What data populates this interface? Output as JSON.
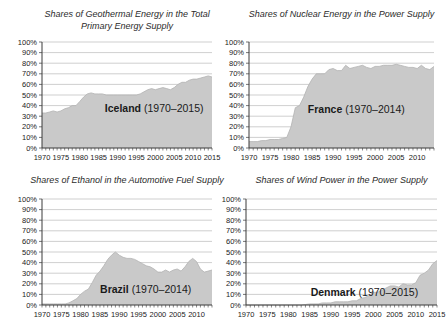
{
  "colors": {
    "area_fill": "#c9c9c9",
    "area_edge": "#b2b2b2",
    "grid": "#c3c3c3",
    "axis": "#3a3a3a",
    "tick_text": "#222222",
    "title_text": "#2b2b2b"
  },
  "chart_data": [
    {
      "id": "geothermal-iceland",
      "type": "area",
      "title": "Shares of Geothermal Energy in the Total Primary Energy Supply",
      "title_lines": [
        "Shares of Geothermal Energy in the Total",
        "Primary Energy Supply"
      ],
      "label_country": "Iceland",
      "label_range": "(1970–2015)",
      "xlim": [
        1970,
        2015
      ],
      "ylim": [
        0,
        100
      ],
      "grid": true,
      "x_tick_labels": [
        "1970",
        "1975",
        "1980",
        "1985",
        "1990",
        "1995",
        "2000",
        "2005",
        "2010",
        "2015"
      ],
      "y_tick_labels": [
        "0%",
        "10%",
        "20%",
        "30%",
        "40%",
        "50%",
        "60%",
        "70%",
        "80%",
        "90%",
        "100%"
      ],
      "x_start": 1970,
      "values": [
        33,
        33,
        34,
        35,
        34,
        35,
        37,
        38,
        40,
        40,
        44,
        48,
        51,
        52,
        51,
        51,
        51,
        50,
        50,
        50,
        50,
        50,
        50,
        50,
        50,
        50,
        51,
        53,
        55,
        56,
        55,
        56,
        57,
        56,
        55,
        57,
        60,
        62,
        62,
        64,
        65,
        65,
        66,
        67,
        68,
        67
      ],
      "layout": {
        "plot": [
          42,
          42,
          212,
          148
        ],
        "label_fx": 0.66,
        "label_fy": 38
      }
    },
    {
      "id": "nuclear-france",
      "type": "area",
      "title": "Shares of Nuclear Energy in the Power Supply",
      "title_lines": [
        "Shares of Nuclear Energy in the Power Supply"
      ],
      "label_country": "France",
      "label_range": "(1970–2014)",
      "xlim": [
        1970,
        2014
      ],
      "ylim": [
        0,
        100
      ],
      "grid": true,
      "x_tick_labels": [
        "1970",
        "1975",
        "1980",
        "1985",
        "1990",
        "1995",
        "2000",
        "2005",
        "2010"
      ],
      "y_tick_labels": [
        "0%",
        "10%",
        "20%",
        "30%",
        "40%",
        "50%",
        "60%",
        "70%",
        "80%",
        "90%",
        "100%"
      ],
      "x_start": 1970,
      "values": [
        6,
        6,
        6,
        7,
        7,
        8,
        8,
        8,
        9,
        10,
        20,
        38,
        40,
        48,
        58,
        65,
        70,
        70,
        70,
        74,
        75,
        73,
        73,
        78,
        75,
        76,
        77,
        78,
        76,
        75,
        77,
        77,
        78,
        78,
        78,
        79,
        78,
        77,
        76,
        76,
        75,
        78,
        75,
        74,
        77
      ],
      "layout": {
        "plot": [
          26,
          42,
          211,
          148
        ],
        "label_fx": 0.58,
        "label_fy": 37
      }
    },
    {
      "id": "ethanol-brazil",
      "type": "area",
      "title": "Shares of Ethanol in the Automotive Fuel Supply",
      "title_lines": [
        "Shares of Ethanol in the Automotive Fuel Supply"
      ],
      "label_country": "Brazil",
      "label_range": "(1970–2014)",
      "xlim": [
        1970,
        2014
      ],
      "ylim": [
        0,
        100
      ],
      "grid": true,
      "x_tick_labels": [
        "1970",
        "1975",
        "1980",
        "1985",
        "1990",
        "1995",
        "2000",
        "2005",
        "2010"
      ],
      "y_tick_labels": [
        "0%",
        "10%",
        "20%",
        "30%",
        "40%",
        "50%",
        "60%",
        "70%",
        "80%",
        "90%",
        "100%"
      ],
      "x_start": 1970,
      "values": [
        1,
        1,
        1,
        1,
        1,
        1,
        1,
        2,
        4,
        6,
        10,
        13,
        15,
        21,
        28,
        32,
        37,
        43,
        47,
        50,
        47,
        45,
        44,
        44,
        43,
        41,
        39,
        37,
        36,
        34,
        31,
        31,
        33,
        31,
        33,
        34,
        32,
        36,
        41,
        44,
        41,
        34,
        31,
        32,
        33
      ],
      "layout": {
        "plot": [
          42,
          33,
          212,
          139
        ],
        "label_fx": 0.61,
        "label_fy": 15
      }
    },
    {
      "id": "wind-denmark",
      "type": "area",
      "title": "Shares of Wind Power in the Power Supply",
      "title_lines": [
        "Shares of Wind Power in the Power Supply"
      ],
      "label_country": "Denmark",
      "label_range": "(1970–2015)",
      "xlim": [
        1970,
        2015
      ],
      "ylim": [
        0,
        100
      ],
      "grid": true,
      "x_tick_labels": [
        "1970",
        "1975",
        "1980",
        "1985",
        "1990",
        "1995",
        "2000",
        "2005",
        "2010",
        "2015"
      ],
      "y_tick_labels": [
        "0%",
        "10%",
        "20%",
        "30%",
        "40%",
        "50%",
        "60%",
        "70%",
        "80%",
        "90%",
        "100%"
      ],
      "x_start": 1970,
      "values": [
        0,
        0,
        0,
        0,
        0,
        0,
        0,
        0,
        0,
        0,
        0,
        0,
        0,
        0,
        0.5,
        1,
        1,
        1,
        2,
        2,
        2,
        3,
        3,
        3,
        3,
        4,
        4,
        6,
        7,
        9,
        12,
        12,
        14,
        16,
        18,
        18,
        17,
        20,
        19,
        19,
        21,
        28,
        30,
        33,
        39,
        42
      ],
      "layout": {
        "plot": [
          23,
          33,
          214,
          139
        ],
        "label_fx": 0.62,
        "label_fy": 12
      }
    }
  ]
}
